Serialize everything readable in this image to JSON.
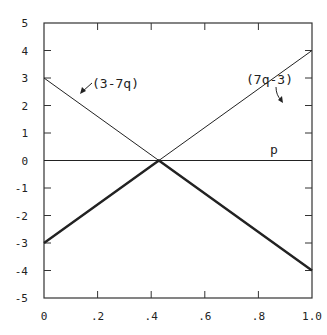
{
  "chart_data": {
    "type": "line",
    "title": "",
    "xlabel": "",
    "ylabel": "",
    "xlim": [
      0,
      1.0
    ],
    "ylim": [
      -5,
      5
    ],
    "grid": false,
    "x_ticks": [
      "0",
      ".2",
      ".4",
      ".6",
      ".8",
      "1.0"
    ],
    "y_ticks": [
      "5",
      "4",
      "3",
      "2",
      "1",
      "0",
      "-1",
      "-2",
      "-3",
      "-4",
      "-5"
    ],
    "series": [
      {
        "name": "(3-7q)",
        "x": [
          0,
          1.0
        ],
        "y": [
          3,
          -4
        ],
        "style": "thin"
      },
      {
        "name": "(7q-3)",
        "x": [
          0,
          1.0
        ],
        "y": [
          -3,
          4
        ],
        "style": "thin"
      },
      {
        "name": "p",
        "x": [
          0,
          1.0
        ],
        "y": [
          0,
          0
        ],
        "style": "thin"
      },
      {
        "name": "lower envelope",
        "x": [
          0,
          0.4286,
          1.0
        ],
        "y": [
          -3,
          0,
          -4
        ],
        "style": "thick"
      }
    ],
    "annotations": [
      {
        "text": "(3-7q)",
        "points_to": "line 3-7q"
      },
      {
        "text": "(7q-3)",
        "points_to": "line 7q-3"
      },
      {
        "text": "p",
        "near": "zero line"
      }
    ]
  },
  "labels": {
    "line_a": "(3-7q)",
    "line_b": "(7q-3)",
    "zero_line": "p"
  }
}
